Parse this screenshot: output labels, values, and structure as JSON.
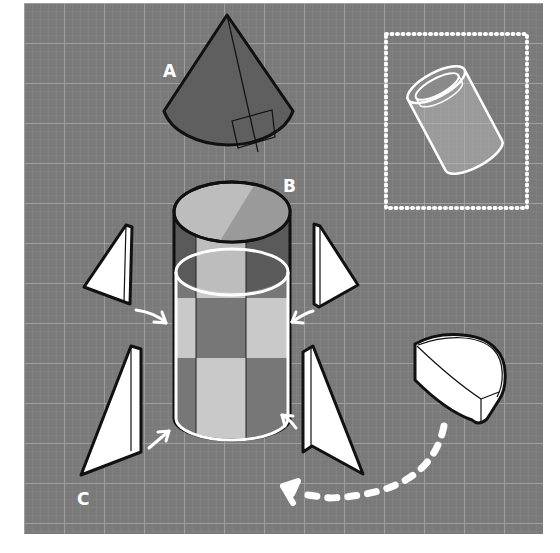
{
  "diagram": {
    "type": "assembly-illustration",
    "background": {
      "color": "#7a7a7a",
      "grid_color": "#9a9a9a",
      "panel": [
        24,
        3,
        519,
        531
      ]
    },
    "labels": {
      "A": "A",
      "B": "B",
      "C": "C"
    },
    "parts": [
      {
        "id": "A",
        "name": "cone nose",
        "shape": "cone",
        "fill": "#5f5f5f",
        "annotation": "slant height line with right-angle marker"
      },
      {
        "id": "B",
        "name": "body tube",
        "shape": "cylinder",
        "stripes": [
          "#5a5a5a",
          "#b8b8b8"
        ],
        "highlight": "white ring marking inner sleeve"
      },
      {
        "id": "C",
        "name": "fins",
        "shape": "triangular prisms",
        "count": 4,
        "fill": "#ffffff"
      },
      {
        "id": "base",
        "name": "half-cylinder base",
        "shape": "half cylinder",
        "fill": "#ffffff"
      }
    ],
    "inset": {
      "name": "tube detail",
      "shape": "tilted hollow cylinder",
      "border": "dotted white"
    },
    "arrows": [
      {
        "from": "fin-upper-left",
        "to": "body",
        "style": "white solid"
      },
      {
        "from": "fin-upper-right",
        "to": "body",
        "style": "white solid"
      },
      {
        "from": "fin-lower-left",
        "to": "body",
        "style": "white solid"
      },
      {
        "from": "fin-lower-right",
        "to": "body",
        "style": "white solid"
      },
      {
        "from": "half-cylinder",
        "to": "bottom-left",
        "style": "white dashed curve"
      }
    ],
    "colors": {
      "outline": "#111111",
      "white": "#ffffff",
      "dark_part": "#5b5b5b",
      "light_part": "#bdbdbd"
    }
  }
}
